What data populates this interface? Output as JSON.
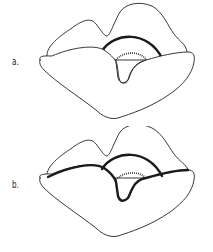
{
  "figures": [
    {
      "label": "a.",
      "description": "Lip outline with upper arc highlighted"
    },
    {
      "label": "b.",
      "description": "Lip outline with upper arc and lower-lip upper border highlighted"
    }
  ],
  "colors": {
    "stroke": "#222222",
    "background": "#ffffff"
  }
}
